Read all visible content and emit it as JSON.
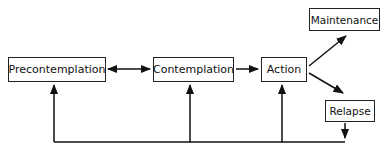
{
  "diagram": {
    "nodes": [
      {
        "id": "precontemplation",
        "label": "Precontemplation"
      },
      {
        "id": "contemplation",
        "label": "Contemplation"
      },
      {
        "id": "action",
        "label": "Action"
      },
      {
        "id": "maintenance",
        "label": "Maintenance"
      },
      {
        "id": "relapse",
        "label": "Relapse"
      }
    ],
    "edges": [
      {
        "from": "precontemplation",
        "to": "contemplation",
        "bidirectional": true
      },
      {
        "from": "contemplation",
        "to": "action"
      },
      {
        "from": "action",
        "to": "maintenance"
      },
      {
        "from": "action",
        "to": "relapse"
      },
      {
        "from": "relapse",
        "to": "feedback-line"
      },
      {
        "from": "feedback-line",
        "to": "precontemplation"
      },
      {
        "from": "feedback-line",
        "to": "contemplation"
      },
      {
        "from": "feedback-line",
        "to": "action"
      }
    ]
  }
}
